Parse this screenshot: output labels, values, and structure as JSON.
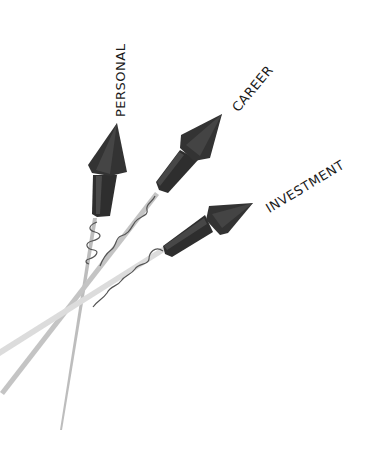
{
  "illustration": {
    "description": "Three rockets labeled with life goals",
    "rockets": [
      {
        "label": "PERSONAL",
        "icon": "rocket-icon"
      },
      {
        "label": "CAREER",
        "icon": "rocket-icon"
      },
      {
        "label": "INVESTMENT",
        "icon": "rocket-icon"
      }
    ],
    "colors": {
      "background": "#ffffff",
      "rocket_body": "#333333",
      "rocket_highlight": "#4a4a4a",
      "stick": "#c8c8c8",
      "fuse": "#555555",
      "text": "#1a1a1a"
    }
  }
}
